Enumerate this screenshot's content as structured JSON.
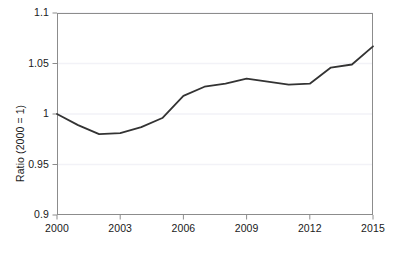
{
  "chart_data": {
    "type": "line",
    "title": "",
    "subtitle": "",
    "xlabel": "",
    "ylabel": "Ratio (2000 = 1)",
    "xlim": [
      2000,
      2015
    ],
    "ylim": [
      0.9,
      1.1
    ],
    "grid": true,
    "grid_axis": "y",
    "legend": false,
    "legend_position": "none",
    "line_color": "#333333",
    "line_width": 1.8,
    "markers": false,
    "y_ticks": [
      0.9,
      0.95,
      1,
      1.05,
      1.1
    ],
    "y_tick_labels": [
      "0.9",
      "0.95",
      "1",
      "1.05",
      "1.1"
    ],
    "x_ticks": [
      2000,
      2003,
      2006,
      2009,
      2012,
      2015
    ],
    "x_tick_labels": [
      "2000",
      "2003",
      "2006",
      "2009",
      "2012",
      "2015"
    ],
    "x": [
      2000,
      2001,
      2002,
      2003,
      2004,
      2005,
      2006,
      2007,
      2008,
      2009,
      2010,
      2011,
      2012,
      2013,
      2014,
      2015
    ],
    "series": [
      {
        "name": "Ratio (2000 = 1)",
        "values": [
          1.0,
          0.989,
          0.98,
          0.981,
          0.987,
          0.996,
          1.018,
          1.027,
          1.03,
          1.035,
          1.032,
          1.029,
          1.03,
          1.046,
          1.049,
          1.067
        ]
      }
    ],
    "annotations": []
  },
  "figure": {
    "background_color": "#ffffff",
    "frame_color": "#8c8c8c",
    "grid_color": "#f2f2f7",
    "tick_color": "#8c8c8c",
    "text_color": "#1a1a1a"
  }
}
